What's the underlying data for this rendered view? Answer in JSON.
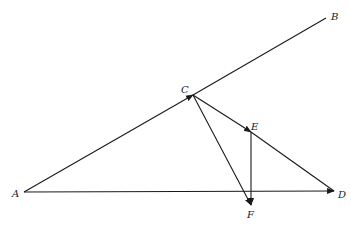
{
  "diagram": {
    "type": "vector-geometry",
    "points": {
      "A": {
        "label": "A",
        "x": 24,
        "y": 192,
        "lx": 12,
        "ly": 197
      },
      "B": {
        "label": "B",
        "x": 326,
        "y": 18,
        "lx": 331,
        "ly": 20
      },
      "C": {
        "label": "C",
        "x": 193,
        "y": 95,
        "lx": 181,
        "ly": 93
      },
      "D": {
        "label": "D",
        "x": 334,
        "y": 191,
        "lx": 338,
        "ly": 198
      },
      "E": {
        "label": "E",
        "x": 251,
        "y": 132,
        "lx": 251,
        "ly": 130
      },
      "F": {
        "label": "F",
        "x": 251,
        "y": 205,
        "lx": 247,
        "ly": 218
      }
    },
    "segments": [
      {
        "from": "A",
        "to": "C",
        "arrow": true
      },
      {
        "from": "C",
        "to": "B",
        "arrow": false
      },
      {
        "from": "C",
        "to": "E",
        "arrow": true
      },
      {
        "from": "E",
        "to": "D",
        "arrow": false
      },
      {
        "from": "A",
        "to": "D",
        "arrow": true
      },
      {
        "from": "C",
        "to": "F",
        "arrow": true
      },
      {
        "from": "E",
        "to": "F",
        "arrow": true
      }
    ],
    "colors": {
      "line": "#1a1a1a",
      "background": "#ffffff"
    }
  }
}
